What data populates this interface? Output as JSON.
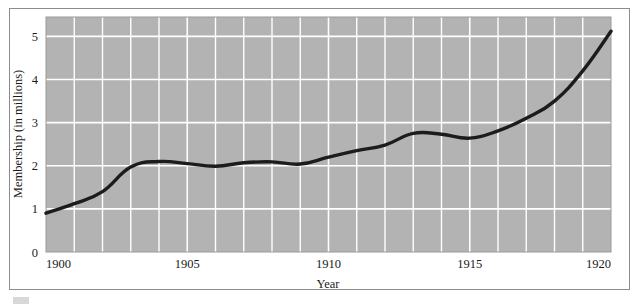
{
  "figure": {
    "background_color": "#ffffff",
    "frame_color": "#8c8c8c",
    "plot_background_color": "#b3b3b3",
    "grid_color": "#ffffff",
    "line_color": "#1c1c1c"
  },
  "chart_data": {
    "type": "line",
    "title": "",
    "subtitle": "",
    "xlabel": "Year",
    "ylabel": "Membership (in millions)",
    "xlim": [
      1900,
      1920
    ],
    "ylim": [
      0,
      5.45
    ],
    "grid": true,
    "legend": false,
    "legend_position": "none",
    "x_tick_labels": [
      "1900",
      "1905",
      "1910",
      "1915",
      "1920"
    ],
    "x_ticks": [
      1900,
      1905,
      1910,
      1915,
      1920
    ],
    "x_minor_gridlines": [
      1901,
      1902,
      1903,
      1904,
      1906,
      1907,
      1908,
      1909,
      1911,
      1912,
      1913,
      1914,
      1916,
      1917,
      1918,
      1919
    ],
    "y_tick_labels": [
      "0",
      "1",
      "2",
      "3",
      "4",
      "5"
    ],
    "y_ticks": [
      0,
      1,
      2,
      3,
      4,
      5
    ],
    "x": [
      1900,
      1901,
      1902,
      1903,
      1904,
      1905,
      1906,
      1907,
      1908,
      1909,
      1910,
      1911,
      1912,
      1913,
      1914,
      1915,
      1916,
      1917,
      1918,
      1919,
      1920
    ],
    "series": [
      {
        "name": "Membership",
        "values": [
          0.9,
          1.12,
          1.4,
          1.97,
          2.1,
          2.05,
          1.99,
          2.07,
          2.09,
          2.04,
          2.2,
          2.35,
          2.48,
          2.75,
          2.73,
          2.64,
          2.81,
          3.1,
          3.5,
          4.2,
          5.12
        ]
      }
    ]
  },
  "axes": {
    "x_axis_title": "Year",
    "y_axis_title": "Membership (in millions)"
  }
}
